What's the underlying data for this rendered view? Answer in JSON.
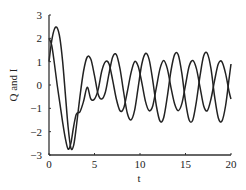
{
  "chart_data": {
    "type": "line",
    "title": "",
    "xlabel": "t",
    "ylabel": "Q and I",
    "xlim": [
      0,
      20
    ],
    "ylim": [
      -3,
      3
    ],
    "xticks": [
      0,
      5,
      10,
      15,
      20
    ],
    "yticks": [
      -3,
      -2,
      -1,
      0,
      1,
      2,
      3
    ],
    "grid": false,
    "legend": null,
    "series": [
      {
        "name": "Q",
        "x": [
          0,
          0.3,
          0.6,
          0.9,
          1.2,
          1.5,
          1.8,
          2.1,
          2.4,
          2.7,
          3.0,
          3.4,
          3.8,
          4.2,
          4.6,
          5.0,
          5.4,
          5.8,
          6.2,
          6.6,
          7.0,
          7.4,
          7.8,
          8.2,
          8.6,
          9.0,
          9.4,
          9.8,
          10.2,
          10.6,
          11.0,
          11.4,
          11.8,
          12.2,
          12.6,
          13.0,
          13.4,
          13.8,
          14.2,
          14.6,
          15.0,
          15.4,
          15.8,
          16.2,
          16.6,
          17.0,
          17.4,
          17.8,
          18.2,
          18.6,
          19.0,
          19.4,
          19.8,
          20.0
        ],
        "y": [
          1.0,
          1.9,
          2.4,
          2.45,
          2.0,
          1.0,
          -0.4,
          -1.8,
          -2.7,
          -2.6,
          -1.8,
          -0.5,
          0.6,
          1.2,
          1.1,
          0.4,
          -0.4,
          -0.6,
          -0.3,
          0.5,
          1.2,
          1.3,
          0.7,
          -0.3,
          -1.2,
          -1.5,
          -1.1,
          -0.1,
          0.9,
          1.35,
          1.1,
          0.2,
          -0.9,
          -1.55,
          -1.4,
          -0.5,
          0.6,
          1.3,
          1.3,
          0.5,
          -0.7,
          -1.5,
          -1.5,
          -0.7,
          0.4,
          1.25,
          1.35,
          0.7,
          -0.5,
          -1.4,
          -1.55,
          -0.9,
          0.3,
          0.9
        ]
      },
      {
        "name": "I",
        "x": [
          0,
          0.3,
          0.6,
          0.9,
          1.2,
          1.5,
          1.8,
          2.1,
          2.4,
          2.7,
          3.0,
          3.4,
          3.8,
          4.2,
          4.6,
          5.0,
          5.4,
          5.8,
          6.2,
          6.6,
          7.0,
          7.4,
          7.8,
          8.2,
          8.6,
          9.0,
          9.4,
          9.8,
          10.2,
          10.6,
          11.0,
          11.4,
          11.8,
          12.2,
          12.6,
          13.0,
          13.4,
          13.8,
          14.2,
          14.6,
          15.0,
          15.4,
          15.8,
          16.2,
          16.6,
          17.0,
          17.4,
          17.8,
          18.2,
          18.6,
          19.0,
          19.4,
          19.8,
          20.0
        ],
        "y": [
          2.0,
          1.7,
          0.9,
          0.0,
          -0.8,
          -1.6,
          -2.3,
          -2.75,
          -2.5,
          -1.8,
          -1.25,
          -1.15,
          -0.7,
          -0.1,
          -0.6,
          -0.6,
          -0.2,
          0.6,
          1.0,
          0.9,
          0.2,
          -0.6,
          -1.1,
          -1.0,
          -0.3,
          0.5,
          1.0,
          0.8,
          0.1,
          -0.7,
          -1.1,
          -0.9,
          -0.1,
          0.7,
          1.05,
          0.7,
          -0.1,
          -0.8,
          -1.1,
          -0.8,
          0.0,
          0.8,
          1.05,
          0.7,
          -0.1,
          -0.9,
          -1.1,
          -0.6,
          0.2,
          0.9,
          1.0,
          0.5,
          -0.3,
          -0.6
        ]
      }
    ],
    "line_color": "#222222"
  }
}
